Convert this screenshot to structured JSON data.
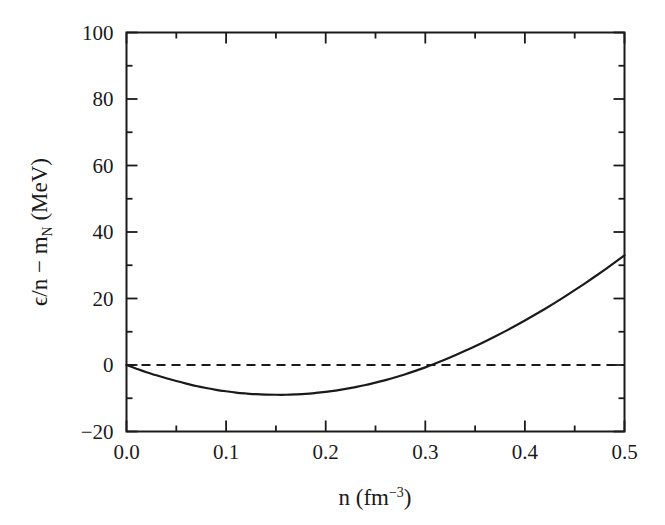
{
  "chart_data": {
    "type": "line",
    "title": "",
    "xlabel": "n (fm−3)",
    "ylabel": "ϵ/n − m_N (MeV)",
    "xlim": [
      0.0,
      0.5
    ],
    "ylim": [
      -20,
      100
    ],
    "grid": false,
    "legend": null,
    "xticks": [
      0.0,
      0.1,
      0.2,
      0.3,
      0.4,
      0.5
    ],
    "xtick_labels": [
      "0.0",
      "0.1",
      "0.2",
      "0.3",
      "0.4",
      "0.5"
    ],
    "yticks": [
      -20,
      0,
      20,
      40,
      60,
      80,
      100
    ],
    "ytick_labels": [
      "-20",
      "0",
      "20",
      "40",
      "60",
      "80",
      "100"
    ],
    "minor_xticks_per_interval": 1,
    "minor_yticks_per_interval": 1,
    "series": [
      {
        "name": "binding-energy-curve",
        "style": "solid",
        "color": "#1a1a1a",
        "x": [
          0.0,
          0.01,
          0.02,
          0.03,
          0.04,
          0.05,
          0.06,
          0.07,
          0.08,
          0.09,
          0.1,
          0.11,
          0.12,
          0.13,
          0.14,
          0.15,
          0.16,
          0.17,
          0.18,
          0.19,
          0.2,
          0.21,
          0.22,
          0.23,
          0.24,
          0.25,
          0.26,
          0.27,
          0.28,
          0.29,
          0.3,
          0.31,
          0.32,
          0.33,
          0.34,
          0.35,
          0.36,
          0.37,
          0.38,
          0.39,
          0.4,
          0.41,
          0.42,
          0.43,
          0.44,
          0.45,
          0.46,
          0.47,
          0.48,
          0.49,
          0.5
        ],
        "y": [
          0.0,
          -2.0,
          -3.9,
          -5.6,
          -7.2,
          -8.7,
          -10.1,
          -11.4,
          -12.5,
          -13.5,
          -14.3,
          -15.0,
          -15.5,
          -15.9,
          -16.1,
          -16.2,
          -16.2,
          -16.0,
          -15.7,
          -15.2,
          -14.6,
          -13.9,
          -13.0,
          -12.0,
          -10.9,
          -9.6,
          -8.2,
          -6.7,
          -5.0,
          -3.2,
          -1.3,
          0.8,
          3.0,
          5.3,
          7.7,
          10.2,
          12.8,
          15.5,
          18.3,
          21.2,
          24.2,
          27.3,
          30.5,
          33.8,
          37.2,
          40.7,
          44.3,
          48.0,
          51.8,
          55.7,
          59.7
        ],
        "x_display_max": 0.5,
        "y_at_xmax": 33,
        "minimum": {
          "x": 0.155,
          "y": -16.2
        },
        "zero_crossing": {
          "x": 0.34,
          "y": 0
        }
      },
      {
        "name": "zero-reference-line",
        "style": "dashed",
        "color": "#1a1a1a",
        "x": [
          0.0,
          0.5
        ],
        "y": [
          0,
          0
        ]
      }
    ]
  },
  "axes": {
    "x_title_main": "n",
    "x_title_unit_open": " (fm",
    "x_title_unit_exp": "−3",
    "x_title_unit_close": ")",
    "y_title_eps": "ϵ/n",
    "y_title_minus": " − m",
    "y_title_sub": "N",
    "y_title_unit": " (MeV)"
  },
  "colors": {
    "background": "#ffffff",
    "axis": "#1a1a1a",
    "curve": "#1a1a1a",
    "dashed": "#1a1a1a"
  }
}
